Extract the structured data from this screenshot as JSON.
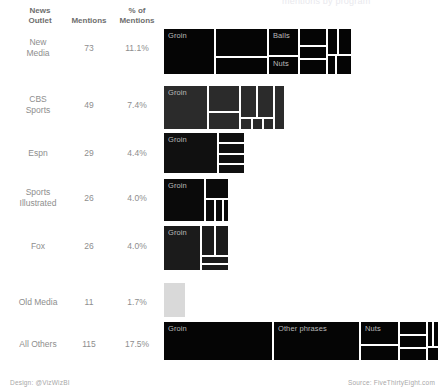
{
  "title_fragment": "mentions by program",
  "table": {
    "headers": {
      "outlet": "News\nOutlet",
      "mentions": "Mentions",
      "pct": "% of\nMentions"
    }
  },
  "footer": {
    "design": "Design: @VizWizBI",
    "source": "Source: FiveThirtyEight.com"
  },
  "chart_data": {
    "type": "treemap",
    "xlabel": "",
    "ylabel": "",
    "legend": "",
    "columns": [
      "News Outlet",
      "Mentions",
      "% of Mentions"
    ],
    "total_mentions": 658,
    "rows": [
      {
        "outlet": "New Media",
        "outlet_display": "New\nMedia",
        "mentions": 73,
        "pct": "11.1%",
        "pct_value": 11.1,
        "color": "#050505",
        "width_px": 189,
        "cells": [
          {
            "label": "Groin",
            "x": 0,
            "y": 0,
            "w": 52,
            "h": 47,
            "value": 22
          },
          {
            "label": "",
            "x": 52,
            "y": 0,
            "w": 53,
            "h": 29,
            "value": 14
          },
          {
            "label": "",
            "x": 52,
            "y": 29,
            "w": 53,
            "h": 18,
            "value": 9
          },
          {
            "label": "Balls",
            "x": 105,
            "y": 0,
            "w": 31,
            "h": 28,
            "value": 8
          },
          {
            "label": "Nuts",
            "x": 105,
            "y": 28,
            "w": 31,
            "h": 19,
            "value": 6
          },
          {
            "label": "",
            "x": 136,
            "y": 0,
            "w": 28,
            "h": 18,
            "value": 4
          },
          {
            "label": "",
            "x": 136,
            "y": 18,
            "w": 28,
            "h": 13,
            "value": 3
          },
          {
            "label": "",
            "x": 136,
            "y": 31,
            "w": 28,
            "h": 16,
            "value": 3
          },
          {
            "label": "",
            "x": 164,
            "y": 0,
            "w": 11,
            "h": 27,
            "value": 2
          },
          {
            "label": "",
            "x": 175,
            "y": 0,
            "w": 14,
            "h": 27,
            "value": 1
          },
          {
            "label": "",
            "x": 164,
            "y": 27,
            "w": 9,
            "h": 20,
            "value": 1
          },
          {
            "label": "",
            "x": 173,
            "y": 27,
            "w": 16,
            "h": 20,
            "value": 0
          }
        ]
      },
      {
        "outlet": "CBS Sports",
        "outlet_display": "CBS\nSports",
        "mentions": 49,
        "pct": "7.4%",
        "pct_value": 7.4,
        "color": "#2b2b2b",
        "width_px": 122,
        "cells": [
          {
            "label": "Groin",
            "x": 0,
            "y": 0,
            "w": 45,
            "h": 45,
            "value": 18
          },
          {
            "label": "",
            "x": 45,
            "y": 0,
            "w": 32,
            "h": 27,
            "value": 9
          },
          {
            "label": "",
            "x": 45,
            "y": 27,
            "w": 32,
            "h": 18,
            "value": 6
          },
          {
            "label": "",
            "x": 77,
            "y": 0,
            "w": 17,
            "h": 33,
            "value": 5
          },
          {
            "label": "",
            "x": 94,
            "y": 0,
            "w": 17,
            "h": 33,
            "value": 4
          },
          {
            "label": "",
            "x": 77,
            "y": 33,
            "w": 12,
            "h": 12,
            "value": 2
          },
          {
            "label": "",
            "x": 89,
            "y": 33,
            "w": 11,
            "h": 12,
            "value": 2
          },
          {
            "label": "",
            "x": 100,
            "y": 33,
            "w": 11,
            "h": 12,
            "value": 2
          },
          {
            "label": "",
            "x": 111,
            "y": 0,
            "w": 11,
            "h": 45,
            "value": 1
          }
        ]
      },
      {
        "outlet": "Espn",
        "outlet_display": "Espn",
        "mentions": 29,
        "pct": "4.4%",
        "pct_value": 4.4,
        "color": "#101010",
        "width_px": 82,
        "cells": [
          {
            "label": "Groin",
            "x": 0,
            "y": 0,
            "w": 55,
            "h": 42,
            "value": 15
          },
          {
            "label": "",
            "x": 55,
            "y": 0,
            "w": 27,
            "h": 11,
            "value": 5
          },
          {
            "label": "",
            "x": 55,
            "y": 11,
            "w": 27,
            "h": 11,
            "value": 4
          },
          {
            "label": "",
            "x": 55,
            "y": 22,
            "w": 27,
            "h": 10,
            "value": 3
          },
          {
            "label": "",
            "x": 55,
            "y": 32,
            "w": 27,
            "h": 10,
            "value": 2
          }
        ]
      },
      {
        "outlet": "Sports Illustrated",
        "outlet_display": "Sports\nIllustrated",
        "mentions": 26,
        "pct": "4.0%",
        "pct_value": 4.0,
        "color": "#0a0a0a",
        "width_px": 66,
        "cells": [
          {
            "label": "Groin",
            "x": 0,
            "y": 0,
            "w": 42,
            "h": 44,
            "value": 14
          },
          {
            "label": "",
            "x": 42,
            "y": 0,
            "w": 24,
            "h": 21,
            "value": 5
          },
          {
            "label": "",
            "x": 42,
            "y": 21,
            "w": 10,
            "h": 23,
            "value": 3
          },
          {
            "label": "",
            "x": 52,
            "y": 21,
            "w": 8,
            "h": 23,
            "value": 2
          },
          {
            "label": "",
            "x": 60,
            "y": 21,
            "w": 6,
            "h": 23,
            "value": 2
          }
        ]
      },
      {
        "outlet": "Fox",
        "outlet_display": "Fox",
        "mentions": 26,
        "pct": "4.0%",
        "pct_value": 4.0,
        "color": "#1b1b1b",
        "width_px": 66,
        "cells": [
          {
            "label": "Groin",
            "x": 0,
            "y": 0,
            "w": 38,
            "h": 46,
            "value": 13
          },
          {
            "label": "",
            "x": 38,
            "y": 0,
            "w": 14,
            "h": 31,
            "value": 5
          },
          {
            "label": "",
            "x": 52,
            "y": 0,
            "w": 14,
            "h": 31,
            "value": 4
          },
          {
            "label": "",
            "x": 38,
            "y": 31,
            "w": 28,
            "h": 8,
            "value": 2
          },
          {
            "label": "",
            "x": 38,
            "y": 39,
            "w": 28,
            "h": 7,
            "value": 2
          }
        ]
      },
      {
        "outlet": "Old Media",
        "outlet_display": "Old Media",
        "mentions": 11,
        "pct": "1.7%",
        "pct_value": 1.7,
        "color": "#d9d9d9",
        "width_px": 23,
        "cells": [
          {
            "label": "",
            "x": 0,
            "y": 0,
            "w": 23,
            "h": 36,
            "value": 11
          }
        ]
      },
      {
        "outlet": "All Others",
        "outlet_display": "All Others",
        "mentions": 115,
        "pct": "17.5%",
        "pct_value": 17.5,
        "color": "#050505",
        "width_px": 276,
        "cells": [
          {
            "label": "Groin",
            "x": 0,
            "y": 0,
            "w": 110,
            "h": 40,
            "value": 40
          },
          {
            "label": "Other phrases",
            "x": 110,
            "y": 0,
            "w": 87,
            "h": 40,
            "value": 30
          },
          {
            "label": "Nuts",
            "x": 197,
            "y": 0,
            "w": 39,
            "h": 24,
            "value": 12
          },
          {
            "label": "",
            "x": 197,
            "y": 24,
            "w": 39,
            "h": 16,
            "value": 8
          },
          {
            "label": "",
            "x": 236,
            "y": 0,
            "w": 28,
            "h": 14,
            "value": 7
          },
          {
            "label": "",
            "x": 236,
            "y": 14,
            "w": 28,
            "h": 13,
            "value": 6
          },
          {
            "label": "",
            "x": 236,
            "y": 27,
            "w": 28,
            "h": 13,
            "value": 5
          },
          {
            "label": "",
            "x": 264,
            "y": 0,
            "w": 6,
            "h": 26,
            "value": 3
          },
          {
            "label": "",
            "x": 270,
            "y": 0,
            "w": 6,
            "h": 26,
            "value": 2
          },
          {
            "label": "",
            "x": 264,
            "y": 26,
            "w": 12,
            "h": 14,
            "value": 2
          }
        ]
      }
    ]
  }
}
